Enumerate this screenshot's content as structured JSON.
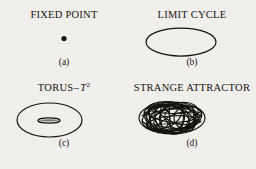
{
  "figure": {
    "background_color": "#f1efec",
    "ink_color": "#15130f",
    "panels": [
      {
        "key": "fixed_point",
        "title": "FIXED POINT",
        "title_prefix": "FIXED POINT",
        "title_symbol": "",
        "title_superscript": "",
        "caption": "(a)",
        "glyph": "filled-dot"
      },
      {
        "key": "limit_cycle",
        "title": "LIMIT CYCLE",
        "title_prefix": "LIMIT CYCLE",
        "title_symbol": "",
        "title_superscript": "",
        "caption": "(b)",
        "glyph": "ellipse-outline"
      },
      {
        "key": "torus",
        "title": "TORUS – T2",
        "title_prefix": "TORUS",
        "title_dash": "–",
        "title_symbol": "T",
        "title_superscript": "2",
        "caption": "(c)",
        "glyph": "torus-outline"
      },
      {
        "key": "strange_attractor",
        "title": "STRANGE ATTRACTOR",
        "title_prefix": "STRANGE ATTRACTOR",
        "title_symbol": "",
        "title_superscript": "",
        "caption": "(d)",
        "glyph": "tangled-trajectory-blob"
      }
    ]
  }
}
